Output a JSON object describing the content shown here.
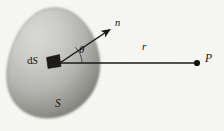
{
  "figure": {
    "canvas": {
      "width": 224,
      "height": 131
    },
    "background_color": "#f7f7f4",
    "surface": {
      "name": "S",
      "label": "S",
      "label_x": 55,
      "label_y": 98,
      "fill_light": "#d2d2ce",
      "fill_mid": "#b4b4b0",
      "fill_dark": "#74746f",
      "edge_color": "#6e6e69"
    },
    "area_element": {
      "label_prefix": "d",
      "label_symbol": "S",
      "label": "dS",
      "label_x": 27,
      "label_y": 55,
      "patch_color": "#1d1c1a",
      "patch_x": 46,
      "patch_y": 55,
      "patch_width": 15,
      "patch_height": 13
    },
    "normal_vector": {
      "label": "n",
      "label_x": 115,
      "label_y": 18,
      "from_x": 60,
      "from_y": 63,
      "to_x": 113,
      "to_y": 27,
      "color": "#1a1917"
    },
    "radius_vector": {
      "label": "r",
      "label_x": 142,
      "label_y": 41,
      "from_x": 60,
      "from_y": 63,
      "to_x": 196,
      "to_y": 63,
      "color": "#1a1917"
    },
    "angle": {
      "label": "θ",
      "label_x": 79,
      "label_y": 44,
      "arc_radius": 22,
      "color": "#1a1917"
    },
    "field_point": {
      "label": "P",
      "label_x": 205,
      "label_y": 53,
      "dot_x": 197,
      "dot_y": 63,
      "dot_radius": 3,
      "color": "#141310"
    }
  }
}
